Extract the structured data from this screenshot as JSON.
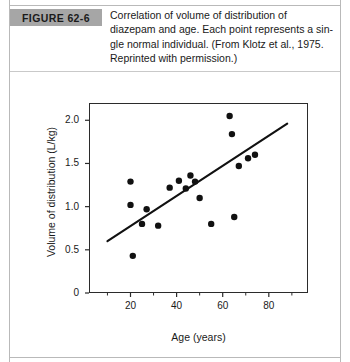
{
  "figure": {
    "label": "FIGURE 62-6",
    "label_bg": "#a6a6a6",
    "caption_lines": [
      "Correlation of volume of distribution of",
      "diazepam and age. Each point represents a sin-",
      "gle normal individual. (From Klotz et al., 1975.",
      "Reprinted with permission.)"
    ]
  },
  "chart_data": {
    "type": "scatter",
    "title": "",
    "xlabel": "Age (years)",
    "ylabel": "Volume of distribution (L/kg)",
    "xlim": [
      2,
      97
    ],
    "ylim": [
      0,
      2.2
    ],
    "grid": false,
    "legend": "none",
    "xticks": [
      20,
      40,
      60,
      80
    ],
    "xtick_labels": [
      "20",
      "40",
      "60",
      "80"
    ],
    "xminor_ticks": [
      10,
      30,
      50,
      70,
      90
    ],
    "yticks": [
      0,
      0.5,
      1.0,
      1.5,
      2.0
    ],
    "ytick_labels": [
      "0",
      "0.5",
      "1.0",
      "1.5",
      "2.0"
    ],
    "point_color": "#111111",
    "line_color": "#111111",
    "points": [
      {
        "x": 20,
        "y": 1.29
      },
      {
        "x": 20,
        "y": 1.02
      },
      {
        "x": 21,
        "y": 0.43
      },
      {
        "x": 25,
        "y": 0.8
      },
      {
        "x": 27,
        "y": 0.97
      },
      {
        "x": 32,
        "y": 0.78
      },
      {
        "x": 37,
        "y": 1.22
      },
      {
        "x": 41,
        "y": 1.3
      },
      {
        "x": 44,
        "y": 1.21
      },
      {
        "x": 46,
        "y": 1.36
      },
      {
        "x": 48,
        "y": 1.29
      },
      {
        "x": 50,
        "y": 1.1
      },
      {
        "x": 55,
        "y": 0.8
      },
      {
        "x": 63,
        "y": 2.05
      },
      {
        "x": 64,
        "y": 1.84
      },
      {
        "x": 65,
        "y": 0.88
      },
      {
        "x": 67,
        "y": 1.47
      },
      {
        "x": 71,
        "y": 1.56
      },
      {
        "x": 74,
        "y": 1.6
      }
    ],
    "trend_line": {
      "name": "regression line",
      "x0": 10,
      "y0": 0.6,
      "x1": 88,
      "y1": 1.96
    }
  }
}
